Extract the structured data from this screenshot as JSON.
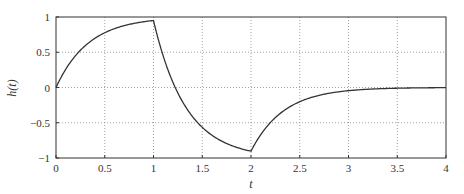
{
  "chart_data": {
    "type": "line",
    "title": "",
    "xlabel": "t",
    "ylabel": "h(t)",
    "xlim": [
      0,
      4
    ],
    "ylim": [
      -1,
      1
    ],
    "grid": true,
    "legend": null,
    "x_ticks": [
      "0",
      "0.5",
      "1",
      "1.5",
      "2",
      "2.5",
      "3",
      "3.5",
      "4"
    ],
    "y_ticks": [
      "1",
      "0.5",
      "0",
      "−0.5",
      "−1"
    ],
    "series": [
      {
        "name": "h(t)",
        "color": "#333333",
        "x": [
          0,
          0.25,
          0.5,
          0.75,
          1.0,
          1.25,
          1.5,
          1.75,
          2.0,
          2.25,
          2.5,
          2.75,
          3.0,
          3.5,
          4.0
        ],
        "y": [
          0,
          0.53,
          0.78,
          0.89,
          0.95,
          0.09,
          -0.57,
          -0.79,
          -0.9,
          -0.43,
          -0.2,
          -0.1,
          -0.045,
          -0.01,
          -0.002
        ]
      }
    ]
  }
}
